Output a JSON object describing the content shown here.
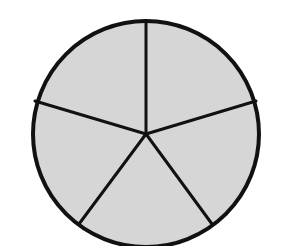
{
  "diagram": {
    "type": "circle-divided-into-equal-parts",
    "parts": 5,
    "shaded_parts": 5,
    "center": [
      146,
      134
    ],
    "radius": 113,
    "fill_color": "#d6d6d6",
    "stroke_color": "#111111",
    "background_color": "#ffffff",
    "divider_angles_deg": [
      -90,
      -18,
      54,
      126,
      198
    ]
  }
}
